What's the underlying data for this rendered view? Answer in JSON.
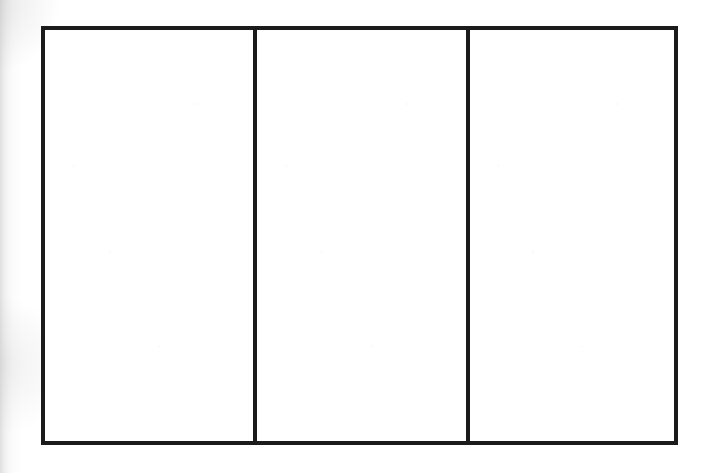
{
  "document": {
    "kind": "scanned-line-diagram",
    "background_color": "#ffffff",
    "ink_color": "#1b1b1b",
    "border_thickness_px": 4
  },
  "figure": {
    "name": "three-panel-rectangle",
    "frame": {
      "left": 41,
      "top": 26,
      "right": 678,
      "bottom": 445,
      "width": 637,
      "height": 419
    },
    "divider_x_positions": [
      257,
      470
    ],
    "panel_count": 3,
    "panels": [
      {
        "id": "panel-1",
        "position": "left",
        "width": 212,
        "content": ""
      },
      {
        "id": "panel-2",
        "position": "center",
        "width": 213,
        "content": ""
      },
      {
        "id": "panel-3",
        "position": "right",
        "width": 204,
        "content": ""
      }
    ]
  },
  "artifacts": {
    "left_margin_shading": true,
    "paper_grain": true
  }
}
